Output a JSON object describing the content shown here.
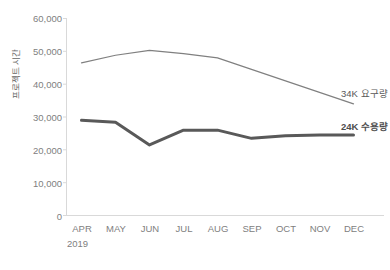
{
  "chart_data": {
    "type": "line",
    "title": "",
    "xlabel": "",
    "ylabel": "프로젝트 시간",
    "categories": [
      "APR",
      "MAY",
      "JUN",
      "JUL",
      "AUG",
      "SEP",
      "OCT",
      "NOV",
      "DEC"
    ],
    "year_label": "2019",
    "ylim": [
      0,
      60000
    ],
    "yticks": [
      0,
      10000,
      20000,
      30000,
      40000,
      50000,
      60000
    ],
    "ytick_labels": [
      "0",
      "10,000",
      "20,000",
      "30,000",
      "40,000",
      "50,000",
      "60,000"
    ],
    "grid": false,
    "legend_position": "inline-right",
    "series": [
      {
        "name": "34K 요구량",
        "label": "34K 요구량",
        "color": "#808080",
        "width": 1.2,
        "bold_label": false,
        "values": [
          46500,
          48800,
          50300,
          49300,
          48000,
          44500,
          41000,
          37500,
          34000
        ]
      },
      {
        "name": "24K 수용량",
        "label": "24K 수용량",
        "color": "#595959",
        "width": 3.0,
        "bold_label": true,
        "values": [
          29000,
          28400,
          21500,
          26000,
          26000,
          23500,
          24300,
          24500,
          24500
        ]
      }
    ]
  },
  "axis": {
    "y_title": "프로젝트 시간",
    "ytick_labels": [
      "60,000",
      "50,000",
      "40,000",
      "30,000",
      "20,000",
      "10,000",
      "0"
    ],
    "xtick_labels": [
      "APR",
      "MAY",
      "JUN",
      "JUL",
      "AUG",
      "SEP",
      "OCT",
      "NOV",
      "DEC"
    ],
    "year": "2019"
  },
  "labels": {
    "series_upper": "34K 요구량",
    "series_lower": "24K 수용량"
  },
  "caption": {
    "text": ""
  },
  "colors": {
    "upper_line": "#808080",
    "lower_line": "#595959",
    "axis": "#d9d9d9",
    "tick_text": "#808080"
  }
}
